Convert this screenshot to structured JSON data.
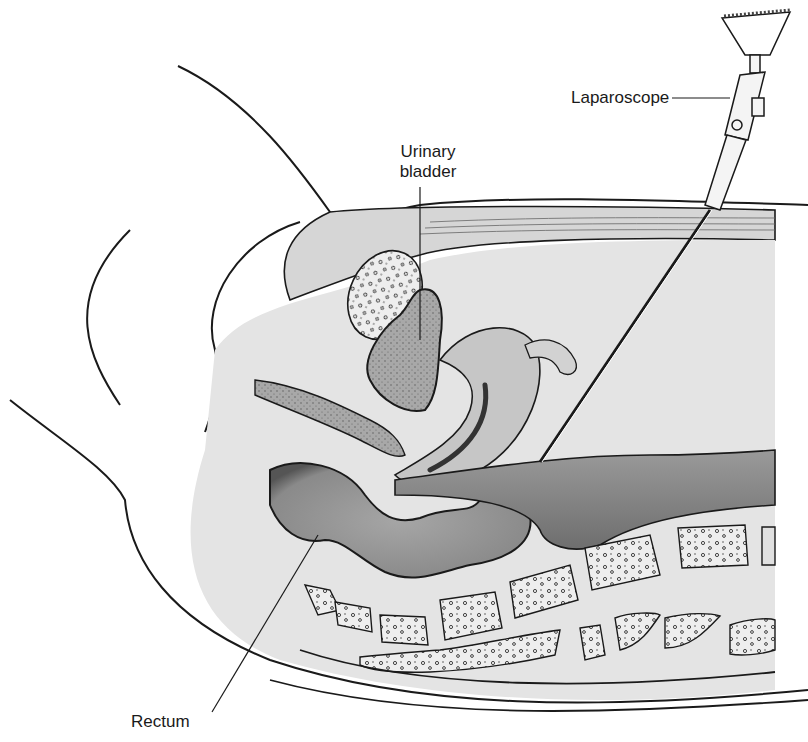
{
  "figure": {
    "colors": {
      "background": "#ffffff",
      "outline": "#1a1a1a",
      "tissue_light": "#dcdcdc",
      "tissue_mid": "#bdbdbd",
      "tissue_dark": "#8c8c8c",
      "bone_fill": "#e6e6e6"
    }
  },
  "labels": {
    "laparoscope": "Laparoscope",
    "urinary_bladder_line1": "Urinary",
    "urinary_bladder_line2": "bladder",
    "rectum": "Rectum"
  }
}
